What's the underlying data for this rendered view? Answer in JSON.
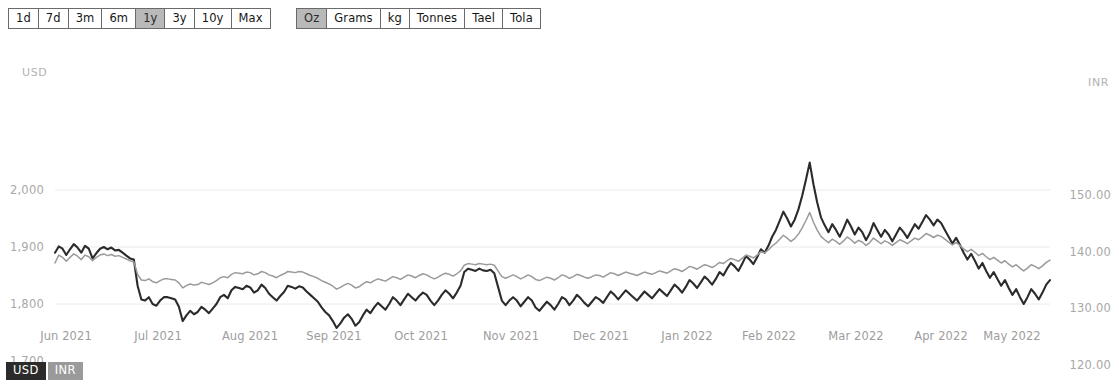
{
  "toolbar": {
    "period_buttons": [
      {
        "label": "1d",
        "active": false
      },
      {
        "label": "7d",
        "active": false
      },
      {
        "label": "3m",
        "active": false
      },
      {
        "label": "6m",
        "active": false
      },
      {
        "label": "1y",
        "active": true
      },
      {
        "label": "3y",
        "active": false
      },
      {
        "label": "10y",
        "active": false
      },
      {
        "label": "Max",
        "active": false
      }
    ],
    "unit_buttons": [
      {
        "label": "Oz",
        "active": true
      },
      {
        "label": "Grams",
        "active": false
      },
      {
        "label": "kg",
        "active": false
      },
      {
        "label": "Tonnes",
        "active": false
      },
      {
        "label": "Tael",
        "active": false
      },
      {
        "label": "Tola",
        "active": false
      }
    ]
  },
  "legend": [
    {
      "label": "USD",
      "color": "#2b2b2b",
      "active": true
    },
    {
      "label": "INR",
      "color": "#9a9a9a",
      "active": false
    }
  ],
  "chart_data": {
    "type": "line",
    "title": "",
    "xlabel": "",
    "grid": true,
    "legend_position": "bottom-left",
    "x_tick_labels": [
      "Jun 2021",
      "Jul 2021",
      "Aug 2021",
      "Sep 2021",
      "Oct 2021",
      "Nov 2021",
      "Dec 2021",
      "Jan 2022",
      "Feb 2022",
      "Mar 2022",
      "Apr 2022",
      "May 2022"
    ],
    "x_tick_positions": [
      66,
      158,
      250,
      334,
      421,
      511,
      601,
      687,
      769,
      856,
      941,
      1012
    ],
    "axes": [
      {
        "id": "left",
        "name": "USD",
        "side": "left",
        "ylim": [
          1700,
          2050
        ],
        "ticks": [
          1700,
          1800,
          1900,
          2000
        ],
        "tick_labels": [
          "1,700",
          "1,800",
          "1,900",
          "2,000"
        ],
        "tick_y": [
          321,
          264,
          207,
          150
        ]
      },
      {
        "id": "right",
        "name": "INR",
        "side": "right",
        "ylim": [
          120,
          156
        ],
        "ticks": [
          120,
          130,
          140,
          150
        ],
        "tick_labels": [
          "120.00",
          "130.00",
          "140.00",
          "150.00"
        ],
        "tick_y": [
          325,
          268,
          212,
          155
        ]
      }
    ],
    "series": [
      {
        "name": "USD",
        "axis": "left",
        "color": "#2b2b2b",
        "width": 2.1,
        "values": [
          1890,
          1901,
          1897,
          1886,
          1896,
          1905,
          1899,
          1890,
          1902,
          1897,
          1880,
          1889,
          1897,
          1900,
          1896,
          1899,
          1894,
          1895,
          1890,
          1885,
          1880,
          1878,
          1832,
          1808,
          1806,
          1812,
          1800,
          1797,
          1806,
          1812,
          1812,
          1810,
          1808,
          1795,
          1770,
          1780,
          1788,
          1782,
          1786,
          1795,
          1790,
          1784,
          1792,
          1800,
          1812,
          1816,
          1810,
          1824,
          1830,
          1828,
          1826,
          1832,
          1829,
          1820,
          1824,
          1834,
          1828,
          1818,
          1812,
          1806,
          1814,
          1821,
          1832,
          1830,
          1827,
          1831,
          1829,
          1822,
          1816,
          1810,
          1804,
          1794,
          1786,
          1780,
          1770,
          1758,
          1766,
          1776,
          1782,
          1774,
          1762,
          1768,
          1780,
          1790,
          1784,
          1794,
          1802,
          1796,
          1790,
          1800,
          1812,
          1806,
          1798,
          1808,
          1818,
          1812,
          1806,
          1814,
          1820,
          1816,
          1806,
          1798,
          1806,
          1816,
          1824,
          1818,
          1810,
          1820,
          1832,
          1856,
          1862,
          1860,
          1858,
          1862,
          1859,
          1858,
          1860,
          1854,
          1830,
          1806,
          1798,
          1806,
          1812,
          1806,
          1796,
          1804,
          1812,
          1806,
          1794,
          1788,
          1796,
          1804,
          1798,
          1790,
          1800,
          1812,
          1808,
          1798,
          1806,
          1816,
          1810,
          1802,
          1796,
          1804,
          1812,
          1808,
          1802,
          1812,
          1822,
          1816,
          1808,
          1816,
          1824,
          1818,
          1812,
          1806,
          1814,
          1822,
          1816,
          1810,
          1818,
          1826,
          1820,
          1814,
          1824,
          1834,
          1828,
          1820,
          1830,
          1842,
          1836,
          1828,
          1838,
          1848,
          1842,
          1834,
          1844,
          1856,
          1850,
          1862,
          1872,
          1866,
          1858,
          1870,
          1884,
          1878,
          1870,
          1882,
          1896,
          1890,
          1902,
          1918,
          1930,
          1946,
          1962,
          1950,
          1936,
          1948,
          1966,
          1990,
          2018,
          2048,
          2010,
          1978,
          1952,
          1938,
          1926,
          1940,
          1930,
          1918,
          1932,
          1948,
          1936,
          1922,
          1934,
          1926,
          1912,
          1924,
          1942,
          1930,
          1918,
          1930,
          1922,
          1910,
          1922,
          1934,
          1926,
          1916,
          1928,
          1940,
          1932,
          1944,
          1956,
          1948,
          1938,
          1948,
          1942,
          1930,
          1918,
          1906,
          1916,
          1904,
          1890,
          1878,
          1888,
          1876,
          1862,
          1872,
          1858,
          1846,
          1856,
          1844,
          1832,
          1842,
          1828,
          1816,
          1826,
          1812,
          1800,
          1812,
          1826,
          1818,
          1808,
          1820,
          1834,
          1842
        ]
      },
      {
        "name": "INR",
        "axis": "right",
        "color": "#9a9a9a",
        "width": 1.5,
        "values": [
          138.0,
          139.4,
          139.0,
          138.3,
          139.0,
          139.6,
          139.2,
          138.6,
          139.4,
          139.1,
          138.4,
          139.0,
          139.4,
          139.6,
          139.3,
          139.5,
          139.2,
          139.3,
          139.0,
          138.7,
          138.4,
          138.2,
          136.0,
          135.0,
          134.9,
          135.2,
          134.7,
          134.5,
          134.9,
          135.2,
          135.2,
          135.1,
          135.0,
          134.5,
          133.6,
          134.0,
          134.3,
          134.1,
          134.2,
          134.6,
          134.4,
          134.2,
          134.5,
          134.9,
          135.4,
          135.6,
          135.4,
          136.0,
          136.3,
          136.2,
          136.1,
          136.4,
          136.3,
          135.9,
          136.1,
          136.5,
          136.3,
          135.9,
          135.7,
          135.4,
          135.8,
          136.1,
          136.5,
          136.4,
          136.3,
          136.5,
          136.4,
          136.1,
          135.8,
          135.6,
          135.3,
          134.9,
          134.6,
          134.3,
          133.9,
          133.4,
          133.7,
          134.1,
          134.4,
          134.1,
          133.6,
          133.8,
          134.3,
          134.7,
          134.5,
          134.9,
          135.2,
          135.0,
          134.8,
          135.2,
          135.6,
          135.4,
          135.1,
          135.5,
          135.9,
          135.7,
          135.4,
          135.8,
          136.1,
          135.9,
          135.5,
          135.2,
          135.5,
          135.9,
          136.2,
          136.0,
          135.7,
          136.1,
          136.6,
          137.6,
          137.9,
          137.8,
          137.7,
          137.9,
          137.8,
          137.7,
          137.8,
          137.6,
          136.6,
          135.6,
          135.3,
          135.6,
          135.9,
          135.6,
          135.2,
          135.5,
          135.9,
          135.6,
          135.1,
          134.9,
          135.2,
          135.5,
          135.3,
          135.0,
          135.4,
          135.9,
          135.7,
          135.3,
          135.6,
          136.0,
          135.8,
          135.5,
          135.3,
          135.6,
          135.9,
          135.8,
          135.5,
          135.9,
          136.3,
          136.1,
          135.8,
          136.1,
          136.4,
          136.2,
          136.0,
          135.8,
          136.1,
          136.4,
          136.2,
          136.0,
          136.3,
          136.6,
          136.4,
          136.2,
          136.6,
          137.0,
          136.8,
          136.5,
          136.9,
          137.4,
          137.2,
          136.9,
          137.3,
          137.7,
          137.5,
          137.2,
          137.6,
          138.1,
          137.9,
          138.4,
          138.8,
          138.6,
          138.3,
          138.8,
          139.4,
          139.2,
          138.9,
          139.4,
          140.0,
          139.8,
          140.3,
          141.0,
          141.5,
          142.2,
          142.9,
          142.4,
          141.8,
          142.3,
          143.1,
          144.2,
          145.5,
          146.9,
          145.2,
          143.8,
          142.7,
          142.1,
          141.6,
          142.2,
          141.8,
          141.3,
          141.9,
          142.6,
          142.1,
          141.5,
          142.0,
          141.7,
          141.1,
          141.6,
          142.4,
          141.9,
          141.4,
          141.9,
          141.6,
          141.1,
          141.6,
          142.1,
          141.8,
          141.4,
          141.9,
          142.4,
          142.1,
          142.6,
          143.2,
          142.9,
          142.5,
          142.9,
          142.7,
          142.2,
          141.7,
          141.2,
          141.6,
          141.1,
          140.5,
          140.0,
          140.4,
          139.9,
          139.3,
          139.7,
          139.1,
          138.6,
          139.0,
          138.5,
          138.0,
          138.4,
          137.8,
          137.3,
          137.7,
          137.1,
          136.6,
          137.1,
          137.7,
          137.4,
          137.0,
          137.5,
          138.1,
          138.5
        ]
      }
    ]
  }
}
